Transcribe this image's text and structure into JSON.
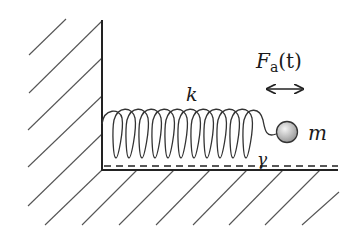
{
  "diagram": {
    "labels": {
      "spring_constant": "k",
      "mass": "m",
      "damping": "γ",
      "force_symbol": "F",
      "force_subscript": "a",
      "force_arg": "(t)"
    },
    "components": {
      "wall": "vertical fixed wall with hatching",
      "floor": "horizontal floor with hatching",
      "spring": "coil spring attached to wall",
      "mass": "shaded sphere",
      "damper_line": "dashed line above floor",
      "force_arrow": "double-headed horizontal arrow"
    },
    "colors": {
      "line": "#222222",
      "hatch": "#555555",
      "mass_light": "#f2f2f2",
      "mass_dark": "#9a9a9a"
    }
  }
}
